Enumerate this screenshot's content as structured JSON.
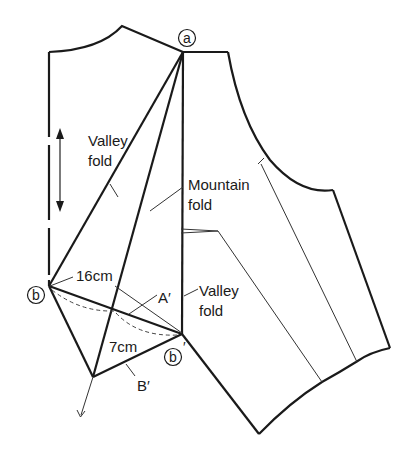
{
  "diagram": {
    "points": {
      "a": {
        "label": "a"
      },
      "b": {
        "label": "b"
      },
      "b_prime": {
        "label": "b",
        "prime": "′"
      }
    },
    "labels": {
      "valley_fold_1_line1": "Valley",
      "valley_fold_1_line2": "fold",
      "mountain_fold_line1": "Mountain",
      "mountain_fold_line2": "fold",
      "valley_fold_2_line1": "Valley",
      "valley_fold_2_line2": "fold",
      "measure_16": "16cm",
      "measure_7": "7cm",
      "a_prime": "A′",
      "b_prime_upper": "B′"
    },
    "colors": {
      "line": "#1a1a1a",
      "background": "#ffffff"
    }
  }
}
